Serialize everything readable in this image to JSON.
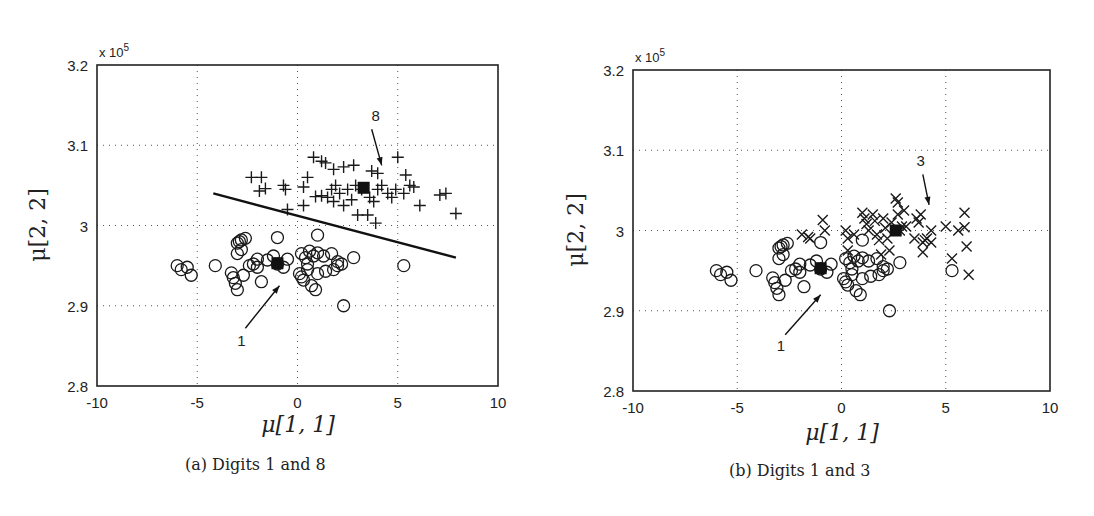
{
  "figure": {
    "panels": [
      {
        "id": "a",
        "caption": "(a) Digits 1 and 8",
        "xlabel": "μ[1, 1]",
        "ylabel": "μ[2, 2]",
        "exponent_label": "x 10",
        "exponent_power": "5",
        "annotation_cluster_1": "1",
        "annotation_cluster_2": "8"
      },
      {
        "id": "b",
        "caption": "(b) Digits 1 and 3",
        "xlabel": "μ[1, 1]",
        "ylabel": "μ[2, 2]",
        "exponent_label": "x 10",
        "exponent_power": "5",
        "annotation_cluster_1": "1",
        "annotation_cluster_2": "3"
      }
    ],
    "x_ticks": [
      "-10",
      "-5",
      "0",
      "5",
      "10"
    ],
    "y_ticks": [
      "2.8",
      "2.9",
      "3",
      "3.1",
      "3.2"
    ]
  },
  "chart_data": [
    {
      "type": "scatter",
      "title": "(a) Digits 1 and 8",
      "xlabel": "μ[1, 1]",
      "ylabel": "μ[2, 2]",
      "y_scale_factor": "x 10^5",
      "xlim": [
        -10,
        10
      ],
      "ylim": [
        2.8,
        3.2
      ],
      "x_ticks": [
        -10,
        -5,
        0,
        5,
        10
      ],
      "y_ticks": [
        2.8,
        2.9,
        3.0,
        3.1,
        3.2
      ],
      "grid": true,
      "series": [
        {
          "name": "Digit 1",
          "marker": "circle",
          "points": [
            [
              -6.0,
              2.95
            ],
            [
              -5.8,
              2.945
            ],
            [
              -5.5,
              2.948
            ],
            [
              -5.3,
              2.938
            ],
            [
              -4.1,
              2.95
            ],
            [
              -3.3,
              2.941
            ],
            [
              -3.2,
              2.935
            ],
            [
              -3.1,
              2.928
            ],
            [
              -3.0,
              2.92
            ],
            [
              -3.0,
              2.965
            ],
            [
              -3.0,
              2.978
            ],
            [
              -2.9,
              2.98
            ],
            [
              -2.8,
              2.982
            ],
            [
              -2.6,
              2.984
            ],
            [
              -2.8,
              2.97
            ],
            [
              -2.7,
              2.938
            ],
            [
              -2.4,
              2.95
            ],
            [
              -2.2,
              2.952
            ],
            [
              -2.0,
              2.958
            ],
            [
              -2.0,
              2.948
            ],
            [
              -1.8,
              2.93
            ],
            [
              -1.5,
              2.957
            ],
            [
              -1.2,
              2.962
            ],
            [
              -1.0,
              2.952
            ],
            [
              -0.7,
              2.948
            ],
            [
              -0.5,
              2.958
            ],
            [
              -1.0,
              2.985
            ],
            [
              0.2,
              2.965
            ],
            [
              0.4,
              2.96
            ],
            [
              0.6,
              2.968
            ],
            [
              0.8,
              2.962
            ],
            [
              1.0,
              2.966
            ],
            [
              1.3,
              2.962
            ],
            [
              0.1,
              2.94
            ],
            [
              0.2,
              2.936
            ],
            [
              0.3,
              2.932
            ],
            [
              0.5,
              2.945
            ],
            [
              0.7,
              2.925
            ],
            [
              0.9,
              2.92
            ],
            [
              1.0,
              2.94
            ],
            [
              1.4,
              2.943
            ],
            [
              1.8,
              2.945
            ],
            [
              2.0,
              2.95
            ],
            [
              2.2,
              2.952
            ],
            [
              2.8,
              2.96
            ],
            [
              1.7,
              2.965
            ],
            [
              2.0,
              2.955
            ],
            [
              0.5,
              2.952
            ],
            [
              1.0,
              2.988
            ],
            [
              2.3,
              2.9
            ],
            [
              5.3,
              2.95
            ]
          ]
        },
        {
          "name": "Digit 8",
          "marker": "plus",
          "points": [
            [
              -2.3,
              3.06
            ],
            [
              -1.8,
              3.06
            ],
            [
              -1.9,
              3.043
            ],
            [
              -1.6,
              3.046
            ],
            [
              -0.7,
              3.05
            ],
            [
              -0.6,
              3.045
            ],
            [
              -0.5,
              3.02
            ],
            [
              0.3,
              3.048
            ],
            [
              0.3,
              3.025
            ],
            [
              0.5,
              3.06
            ],
            [
              0.9,
              3.036
            ],
            [
              1.2,
              3.037
            ],
            [
              1.5,
              3.035
            ],
            [
              1.7,
              3.045
            ],
            [
              1.8,
              3.03
            ],
            [
              1.9,
              3.05
            ],
            [
              2.1,
              3.04
            ],
            [
              2.3,
              3.025
            ],
            [
              2.5,
              3.045
            ],
            [
              2.7,
              3.032
            ],
            [
              2.9,
              3.05
            ],
            [
              3.2,
              3.045
            ],
            [
              3.6,
              3.035
            ],
            [
              3.8,
              3.03
            ],
            [
              4.0,
              3.045
            ],
            [
              4.2,
              3.05
            ],
            [
              4.5,
              3.04
            ],
            [
              4.7,
              3.035
            ],
            [
              4.9,
              3.045
            ],
            [
              5.3,
              3.04
            ],
            [
              5.6,
              3.05
            ],
            [
              5.8,
              3.048
            ],
            [
              6.1,
              3.025
            ],
            [
              7.1,
              3.038
            ],
            [
              7.4,
              3.04
            ],
            [
              7.9,
              3.015
            ],
            [
              0.8,
              3.085
            ],
            [
              1.2,
              3.08
            ],
            [
              1.4,
              3.078
            ],
            [
              1.8,
              3.07
            ],
            [
              2.3,
              3.073
            ],
            [
              2.8,
              3.075
            ],
            [
              3.7,
              3.068
            ],
            [
              4.0,
              3.065
            ],
            [
              5.0,
              3.085
            ],
            [
              5.4,
              3.063
            ],
            [
              3.5,
              3.013
            ],
            [
              3.9,
              3.003
            ],
            [
              3.0,
              3.013
            ]
          ]
        },
        {
          "name": "Class means",
          "marker": "filled-square",
          "points": [
            [
              -1.0,
              2.953
            ],
            [
              3.3,
              3.047
            ]
          ]
        },
        {
          "name": "Decision boundary",
          "marker": "line",
          "points": [
            [
              -4.2,
              3.04
            ],
            [
              7.9,
              2.96
            ]
          ]
        }
      ],
      "annotations": [
        {
          "text": "1",
          "arrow_from": [
            -2.6,
            2.872
          ],
          "arrow_to": [
            -0.9,
            2.925
          ],
          "label_pos": [
            -2.8,
            2.85
          ]
        },
        {
          "text": "8",
          "arrow_from": [
            3.7,
            3.12
          ],
          "arrow_to": [
            4.2,
            3.075
          ],
          "label_pos": [
            3.9,
            3.13
          ]
        }
      ]
    },
    {
      "type": "scatter",
      "title": "(b) Digits 1 and 3",
      "xlabel": "μ[1, 1]",
      "ylabel": "μ[2, 2]",
      "y_scale_factor": "x 10^5",
      "xlim": [
        -10,
        10
      ],
      "ylim": [
        2.8,
        3.2
      ],
      "x_ticks": [
        -10,
        -5,
        0,
        5,
        10
      ],
      "y_ticks": [
        2.8,
        2.9,
        3.0,
        3.1,
        3.2
      ],
      "grid": true,
      "series": [
        {
          "name": "Digit 1",
          "marker": "circle",
          "points": [
            [
              -6.0,
              2.95
            ],
            [
              -5.8,
              2.945
            ],
            [
              -5.5,
              2.948
            ],
            [
              -5.3,
              2.938
            ],
            [
              -4.1,
              2.95
            ],
            [
              -3.3,
              2.941
            ],
            [
              -3.2,
              2.935
            ],
            [
              -3.1,
              2.928
            ],
            [
              -3.0,
              2.92
            ],
            [
              -3.0,
              2.965
            ],
            [
              -3.0,
              2.978
            ],
            [
              -2.9,
              2.98
            ],
            [
              -2.8,
              2.982
            ],
            [
              -2.6,
              2.984
            ],
            [
              -2.8,
              2.97
            ],
            [
              -2.7,
              2.938
            ],
            [
              -2.4,
              2.95
            ],
            [
              -2.2,
              2.952
            ],
            [
              -2.0,
              2.958
            ],
            [
              -2.0,
              2.948
            ],
            [
              -1.8,
              2.93
            ],
            [
              -1.5,
              2.957
            ],
            [
              -1.2,
              2.962
            ],
            [
              -1.0,
              2.952
            ],
            [
              -0.7,
              2.948
            ],
            [
              -0.5,
              2.958
            ],
            [
              -1.0,
              2.985
            ],
            [
              0.2,
              2.965
            ],
            [
              0.4,
              2.96
            ],
            [
              0.6,
              2.968
            ],
            [
              0.8,
              2.962
            ],
            [
              1.0,
              2.966
            ],
            [
              1.3,
              2.962
            ],
            [
              0.1,
              2.94
            ],
            [
              0.2,
              2.936
            ],
            [
              0.3,
              2.932
            ],
            [
              0.5,
              2.945
            ],
            [
              0.7,
              2.925
            ],
            [
              0.9,
              2.92
            ],
            [
              1.0,
              2.94
            ],
            [
              1.4,
              2.943
            ],
            [
              1.8,
              2.945
            ],
            [
              2.0,
              2.95
            ],
            [
              2.2,
              2.952
            ],
            [
              2.8,
              2.96
            ],
            [
              1.7,
              2.965
            ],
            [
              2.0,
              2.955
            ],
            [
              0.5,
              2.952
            ],
            [
              1.0,
              2.988
            ],
            [
              2.3,
              2.9
            ],
            [
              5.3,
              2.95
            ]
          ]
        },
        {
          "name": "Digit 3",
          "marker": "cross",
          "points": [
            [
              -1.9,
              2.995
            ],
            [
              -1.6,
              2.992
            ],
            [
              -1.5,
              2.99
            ],
            [
              -0.9,
              3.013
            ],
            [
              -0.8,
              3.0
            ],
            [
              0.2,
              3.0
            ],
            [
              0.3,
              2.99
            ],
            [
              0.3,
              2.975
            ],
            [
              1.0,
              3.022
            ],
            [
              1.1,
              3.015
            ],
            [
              1.2,
              3.008
            ],
            [
              1.3,
              3.0
            ],
            [
              1.5,
              3.02
            ],
            [
              1.6,
              3.012
            ],
            [
              1.7,
              2.995
            ],
            [
              1.8,
              2.988
            ],
            [
              2.0,
              3.015
            ],
            [
              2.1,
              3.003
            ],
            [
              2.2,
              2.99
            ],
            [
              2.3,
              2.975
            ],
            [
              2.4,
              3.01
            ],
            [
              2.6,
              3.04
            ],
            [
              2.7,
              3.035
            ],
            [
              2.7,
              3.02
            ],
            [
              2.8,
              3.0
            ],
            [
              2.9,
              3.005
            ],
            [
              3.0,
              3.025
            ],
            [
              3.1,
              3.005
            ],
            [
              3.5,
              2.99
            ],
            [
              3.6,
              3.015
            ],
            [
              3.7,
              3.01
            ],
            [
              3.8,
              3.02
            ],
            [
              3.9,
              2.985
            ],
            [
              3.9,
              2.973
            ],
            [
              4.0,
              2.988
            ],
            [
              4.1,
              2.99
            ],
            [
              4.3,
              3.0
            ],
            [
              4.3,
              2.985
            ],
            [
              5.0,
              3.005
            ],
            [
              5.3,
              2.965
            ],
            [
              5.6,
              3.0
            ],
            [
              5.9,
              3.022
            ],
            [
              5.9,
              3.004
            ],
            [
              6.0,
              2.98
            ],
            [
              6.1,
              2.945
            ],
            [
              0.6,
              2.995
            ],
            [
              1.9,
              2.97
            ]
          ]
        },
        {
          "name": "Class means",
          "marker": "filled-square",
          "points": [
            [
              -1.0,
              2.953
            ],
            [
              2.6,
              3.0
            ]
          ]
        }
      ],
      "annotations": [
        {
          "text": "1",
          "arrow_from": [
            -2.7,
            2.87
          ],
          "arrow_to": [
            -1.0,
            2.92
          ],
          "label_pos": [
            -2.9,
            2.85
          ]
        },
        {
          "text": "3",
          "arrow_from": [
            3.9,
            3.07
          ],
          "arrow_to": [
            4.2,
            3.032
          ],
          "label_pos": [
            3.8,
            3.08
          ]
        }
      ]
    }
  ]
}
